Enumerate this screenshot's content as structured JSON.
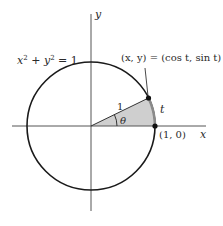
{
  "diagram": {
    "type": "unit-circle",
    "colors": {
      "background": "#ffffff",
      "stroke": "#1a1a1a",
      "axis": "#555555",
      "sector_fill": "#cfcfcf",
      "arc_highlight": "#8a8a8a",
      "text": "#2a2a2a"
    },
    "labels": {
      "y_axis": "y",
      "x_axis": "x",
      "equation_x": "x",
      "equation_exp1": "2",
      "equation_plus": " + ",
      "equation_y": "y",
      "equation_exp2": "2",
      "equation_rhs": " = 1",
      "point_label": "(x, y) = (cos t, sin t)",
      "radius_label": "1",
      "angle_label": "θ",
      "arc_label": "t",
      "start_point_label": "(1, 0)"
    },
    "geometry": {
      "center": [
        91,
        126
      ],
      "radius": 64,
      "angle_deg": 26
    }
  }
}
